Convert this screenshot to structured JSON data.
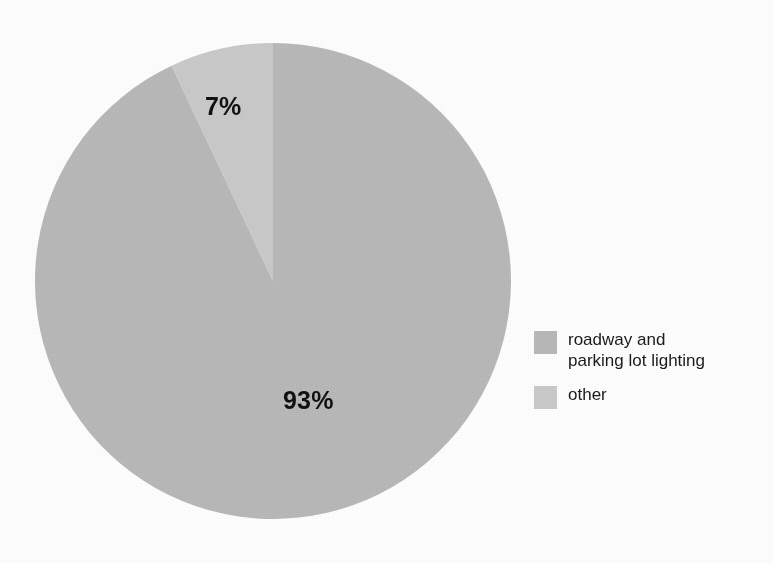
{
  "chart_data": {
    "type": "pie",
    "title": "",
    "subtitle": "",
    "xlabel": "",
    "ylabel": "",
    "grid": false,
    "legend_position": "right",
    "start_angle_deg": 90,
    "direction": "counterclockwise",
    "categories": [
      "roadway and parking lot lighting",
      "other"
    ],
    "values": [
      93,
      7
    ],
    "unit": "%",
    "slices": [
      {
        "label": "roadway and parking lot lighting",
        "legend_label": "roadway and\nparking lot lighting",
        "value": 93,
        "value_label": "93%",
        "color": "#b9b9b9"
      },
      {
        "label": "other",
        "legend_label": "other",
        "value": 7,
        "value_label": "7%",
        "color": "#cacaca"
      }
    ],
    "annotations": [
      "7%",
      "93%"
    ]
  },
  "labels": {
    "small_slice_value": "7%",
    "large_slice_value": "93%"
  },
  "legend": {
    "items": [
      {
        "label": "roadway and\nparking lot lighting",
        "color": "#b9b9b9"
      },
      {
        "label": "other",
        "color": "#cacaca"
      }
    ]
  },
  "colors": {
    "background": "#ffffff",
    "slice_roadway": "#b9b9b9",
    "slice_other": "#cacaca",
    "label_text": "#111111",
    "legend_text": "#1b1b1b"
  }
}
